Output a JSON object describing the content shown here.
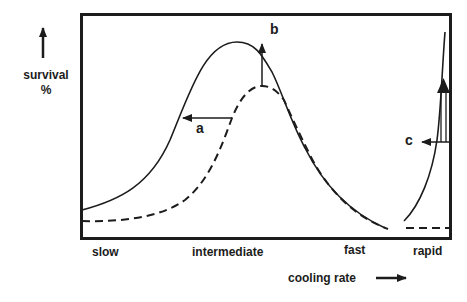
{
  "figure": {
    "y_axis_label_line1": "survival",
    "y_axis_label_line2": "%",
    "x_axis_title": "cooling rate",
    "x_ticks": [
      "slow",
      "intermediate",
      "fast",
      "rapid"
    ],
    "annotations": {
      "a": "a",
      "b": "b",
      "c": "c"
    },
    "series": [
      {
        "name": "solid-curve",
        "style": "solid"
      },
      {
        "name": "dashed-curve",
        "style": "dashed"
      }
    ],
    "colors": {
      "ink": "#1c1c1c",
      "background": "#ffffff"
    }
  }
}
